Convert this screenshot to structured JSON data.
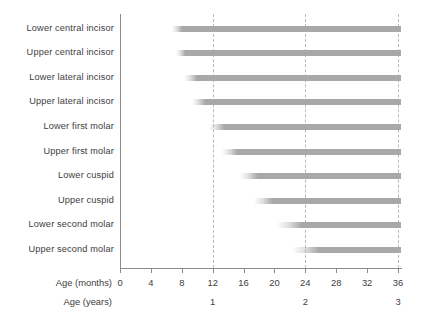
{
  "chart_data": {
    "type": "bar",
    "orientation": "horizontal",
    "title": "",
    "xlabel": "Age (months)",
    "xlabel_secondary": "Age (years)",
    "ylabel": "",
    "xlim": [
      0,
      36
    ],
    "xticks": [
      0,
      4,
      8,
      12,
      16,
      20,
      24,
      28,
      32,
      36
    ],
    "xticklabels": [
      "0",
      "4",
      "8",
      "12",
      "16",
      "20",
      "24",
      "28",
      "32",
      "36"
    ],
    "secondary_xticks": [
      12,
      24,
      36
    ],
    "secondary_xticklabels": [
      "1",
      "2",
      "3"
    ],
    "gridlines": [
      12,
      24,
      36
    ],
    "grid": true,
    "grid_style": "dashed",
    "legend": "none",
    "bar_color": "#a8a8a8",
    "grid_color": "#b9b9b9",
    "axis_color": "#8c8c8c",
    "categories": [
      "Lower central incisor",
      "Upper central incisor",
      "Lower lateral incisor",
      "Upper lateral incisor",
      "Lower first molar",
      "Upper first molar",
      "Lower cuspid",
      "Upper cuspid",
      "Lower second molar",
      "Upper second molar"
    ],
    "bars": [
      {
        "label": "Lower central incisor",
        "fade_start": 6.7,
        "start": 8,
        "end": 36.4
      },
      {
        "label": "Upper central incisor",
        "fade_start": 7.3,
        "start": 8.5,
        "end": 36.4
      },
      {
        "label": "Lower lateral incisor",
        "fade_start": 8.3,
        "start": 10,
        "end": 36.4
      },
      {
        "label": "Upper lateral incisor",
        "fade_start": 9.3,
        "start": 11,
        "end": 36.4
      },
      {
        "label": "Lower first molar",
        "fade_start": 11.5,
        "start": 13.5,
        "end": 36.4
      },
      {
        "label": "Upper first molar",
        "fade_start": 13.2,
        "start": 15.2,
        "end": 36.4
      },
      {
        "label": "Lower cuspid",
        "fade_start": 15.5,
        "start": 17.8,
        "end": 36.4
      },
      {
        "label": "Upper cuspid",
        "fade_start": 17.3,
        "start": 19.7,
        "end": 36.4
      },
      {
        "label": "Lower second molar",
        "fade_start": 20.3,
        "start": 23.5,
        "end": 36.4
      },
      {
        "label": "Upper second molar",
        "fade_start": 22.3,
        "start": 25.8,
        "end": 36.4
      }
    ]
  }
}
